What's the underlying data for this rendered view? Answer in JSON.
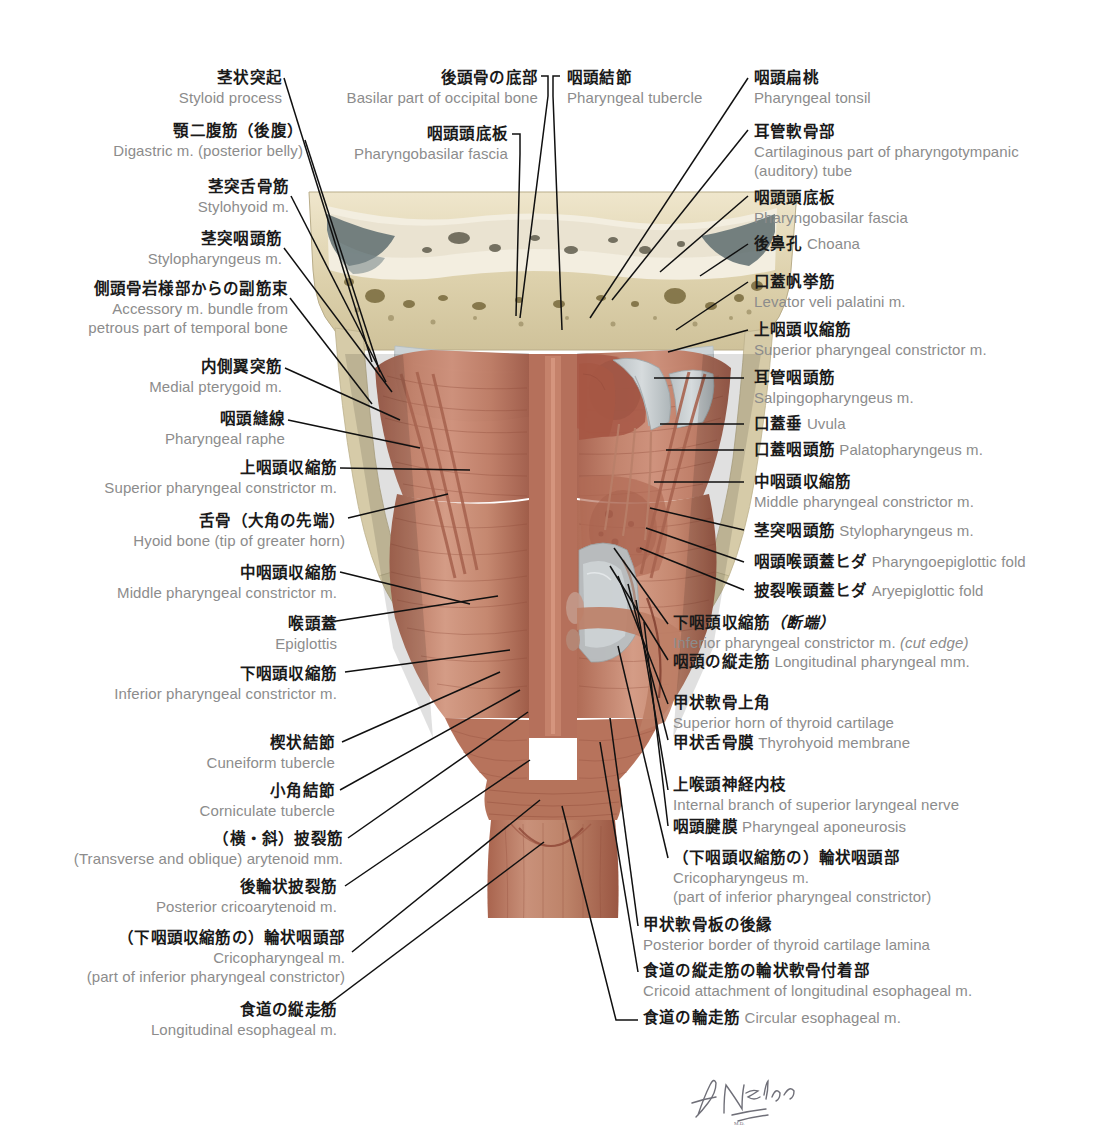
{
  "figure": {
    "signature": "F. Netter",
    "colors": {
      "leader_line": "#101010",
      "japanese_text": "#1a1a1a",
      "english_text": "#8c8c8c",
      "bone": "#d9cfae",
      "muscle": "#b4705c",
      "muscle_light": "#d19a86",
      "cartilage": "#c9ced0",
      "mucosa": "#a85a4a",
      "background": "#ffffff"
    }
  },
  "labels_left": [
    {
      "jp": "茎状突起",
      "en": "Styloid process"
    },
    {
      "jp": "顎二腹筋（後腹）",
      "en": "Digastric m. (posterior belly)"
    },
    {
      "jp": "茎突舌骨筋",
      "en": "Stylohyoid m."
    },
    {
      "jp": "茎突咽頭筋",
      "en": "Stylopharyngeus m."
    },
    {
      "jp": "側頭骨岩様部からの副筋束",
      "en": "Accessory m. bundle from",
      "en2": "petrous part of temporal bone"
    },
    {
      "jp": "内側翼突筋",
      "en": "Medial pterygoid m."
    },
    {
      "jp": "咽頭縫線",
      "en": "Pharyngeal raphe"
    },
    {
      "jp": "上咽頭収縮筋",
      "en": "Superior pharyngeal constrictor m."
    },
    {
      "jp": "舌骨（大角の先端）",
      "en": "Hyoid bone (tip of greater horn)"
    },
    {
      "jp": "中咽頭収縮筋",
      "en": "Middle pharyngeal constrictor m."
    },
    {
      "jp": "喉頭蓋",
      "en": "Epiglottis"
    },
    {
      "jp": "下咽頭収縮筋",
      "en": "Inferior pharyngeal constrictor m."
    },
    {
      "jp": "楔状結節",
      "en": "Cuneiform tubercle"
    },
    {
      "jp": "小角結節",
      "en": "Corniculate tubercle"
    },
    {
      "jp": "（横・斜）披裂筋",
      "en": "(Transverse and oblique) arytenoid mm."
    },
    {
      "jp": "後輪状披裂筋",
      "en": "Posterior cricoarytenoid m."
    },
    {
      "jp": "（下咽頭収縮筋の）輪状咽頭部",
      "en": "Cricopharyngeal m.",
      "en2": "(part of inferior pharyngeal constrictor)"
    },
    {
      "jp": "食道の縦走筋",
      "en": "Longitudinal esophageal m."
    }
  ],
  "labels_top": [
    {
      "jp": "後頭骨の底部",
      "en": "Basilar part of occipital bone"
    },
    {
      "jp": "咽頭頭底板",
      "en": "Pharyngobasilar fascia"
    },
    {
      "jp": "咽頭結節",
      "en": "Pharyngeal tubercle"
    }
  ],
  "labels_right": [
    {
      "jp": "咽頭扁桃",
      "en": "Pharyngeal tonsil"
    },
    {
      "jp": "耳管軟骨部",
      "en": "Cartilaginous part of pharyngotympanic",
      "en2": "(auditory) tube"
    },
    {
      "jp": "咽頭頭底板",
      "en": "Pharyngobasilar fascia"
    },
    {
      "jp": "後鼻孔",
      "en": "Choana",
      "inline": true
    },
    {
      "jp": "口蓋帆挙筋",
      "en": "Levator veli palatini m."
    },
    {
      "jp": "上咽頭収縮筋",
      "en": "Superior pharyngeal constrictor m."
    },
    {
      "jp": "耳管咽頭筋",
      "en": "Salpingopharyngeus m."
    },
    {
      "jp": "口蓋垂",
      "en": "Uvula",
      "inline": true
    },
    {
      "jp": "口蓋咽頭筋",
      "en": "Palatopharyngeus m.",
      "inline": true
    },
    {
      "jp": "中咽頭収縮筋",
      "en": "Middle pharyngeal constrictor m."
    },
    {
      "jp": "茎突咽頭筋",
      "en": "Stylopharyngeus m.",
      "inline": true
    },
    {
      "jp": "咽頭喉頭蓋ヒダ",
      "en": "Pharyngoepiglottic fold",
      "inline": true
    },
    {
      "jp": "披裂喉頭蓋ヒダ",
      "en": "Aryepiglottic fold",
      "inline": true
    },
    {
      "jp": "下咽頭収縮筋（断端）",
      "en": "Inferior pharyngeal constrictor m. (cut edge)",
      "italic_tail": "(cut edge)"
    },
    {
      "jp": "咽頭の縦走筋",
      "en": "Longitudinal pharyngeal mm.",
      "inline": true
    },
    {
      "jp": "甲状軟骨上角",
      "en": "Superior horn of thyroid cartilage"
    },
    {
      "jp": "甲状舌骨膜",
      "en": "Thyrohyoid membrane",
      "inline": true
    },
    {
      "jp": "上喉頭神経内枝",
      "en": "Internal branch of superior laryngeal nerve"
    },
    {
      "jp": "咽頭腱膜",
      "en": "Pharyngeal aponeurosis",
      "inline": true
    },
    {
      "jp": "（下咽頭収縮筋の）輪状咽頭部",
      "en": "Cricopharyngeus m.",
      "en2": "(part of inferior pharyngeal constrictor)"
    },
    {
      "jp": "甲状軟骨板の後縁",
      "en": "Posterior border of thyroid cartilage lamina"
    },
    {
      "jp": "食道の縦走筋の輪状軟骨付着部",
      "en": "Cricoid attachment of longitudinal esophageal m."
    },
    {
      "jp": "食道の輪走筋",
      "en": "Circular esophageal m.",
      "inline": true
    }
  ]
}
